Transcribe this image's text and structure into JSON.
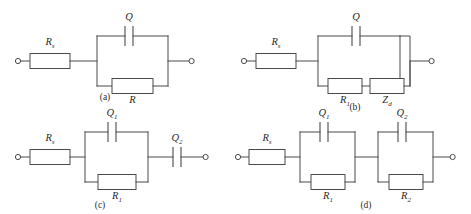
{
  "figure": {
    "type": "equivalent-circuit-diagram",
    "background_color": "#ffffff",
    "line_color": "#4a4a4a",
    "text_color": "#2b2b2b",
    "panel_count": 4
  },
  "panels": [
    {
      "id": "a",
      "caption": "(a)",
      "topology": "Rs in series with parallel combination of Q and R",
      "series_resistor": {
        "base": "R",
        "sub": "s"
      },
      "capacitor_top": {
        "base": "Q",
        "sub": ""
      },
      "branch_bottom": [
        {
          "base": "R",
          "sub": ""
        }
      ]
    },
    {
      "id": "b",
      "caption": "(b)",
      "topology": "Rs in series with parallel combination of Q and (R1 + Zd)",
      "series_resistor": {
        "base": "R",
        "sub": "s"
      },
      "capacitor_top": {
        "base": "Q",
        "sub": ""
      },
      "branch_bottom": [
        {
          "base": "R",
          "sub": "1"
        },
        {
          "base": "Z",
          "sub": "d"
        }
      ]
    },
    {
      "id": "c",
      "caption": "(c)",
      "topology": "Rs in series with (Q1 parallel R1) in series with Q2",
      "series_resistor": {
        "base": "R",
        "sub": "s"
      },
      "capacitor_top": {
        "base": "Q",
        "sub": "1"
      },
      "branch_bottom": [
        {
          "base": "R",
          "sub": "1"
        }
      ],
      "series_capacitor": {
        "base": "Q",
        "sub": "2"
      }
    },
    {
      "id": "d",
      "caption": "(d)",
      "topology": "Rs in series with (Q1 parallel R1) in series with (Q2 parallel R2)",
      "series_resistor": {
        "base": "R",
        "sub": "s"
      },
      "block1": {
        "capacitor_top": {
          "base": "Q",
          "sub": "1"
        },
        "resistor_bottom": {
          "base": "R",
          "sub": "1"
        }
      },
      "block2": {
        "capacitor_top": {
          "base": "Q",
          "sub": "2"
        },
        "resistor_bottom": {
          "base": "R",
          "sub": "2"
        }
      }
    }
  ]
}
